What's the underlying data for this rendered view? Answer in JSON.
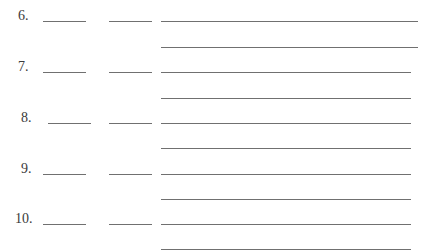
{
  "worksheet": {
    "line_color": "#707070",
    "text_color": "#3a3a3a",
    "items": [
      {
        "number": "6.",
        "num_x": 18,
        "y": 21,
        "blank1_x": 43,
        "blank2_x": 109,
        "extra_y": 47,
        "long_end": 418
      },
      {
        "number": "7.",
        "num_x": 18,
        "y": 72,
        "blank1_x": 43,
        "blank2_x": 109,
        "extra_y": 98,
        "long_end": 411
      },
      {
        "number": "8.",
        "num_x": 21,
        "y": 123,
        "blank1_x": 48,
        "blank2_x": 109,
        "extra_y": 148,
        "long_end": 411
      },
      {
        "number": "9.",
        "num_x": 21,
        "y": 174,
        "blank1_x": 43,
        "blank2_x": 109,
        "extra_y": 199,
        "long_end": 411
      },
      {
        "number": "10.",
        "num_x": 15,
        "y": 224,
        "blank1_x": 43,
        "blank2_x": 109,
        "extra_y": 249,
        "long_end": 411
      }
    ]
  }
}
